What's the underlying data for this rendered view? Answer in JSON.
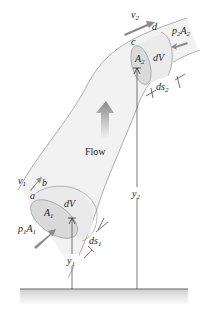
{
  "figure": {
    "colors": {
      "tube_fill": "#f2f2f2",
      "tube_edge": "#9a9a9a",
      "section_fill": "#e2e2e2",
      "arrow_gray": "#8c8c8c",
      "line": "#555555",
      "ground": "#666666"
    },
    "labels": {
      "flow": "Flow",
      "v1": {
        "base": "v",
        "sub": "1"
      },
      "v2": {
        "base": "v",
        "sub": "2"
      },
      "a": "a",
      "b": "b",
      "c": "c",
      "d": "d",
      "A1": {
        "base": "A",
        "sub": "1"
      },
      "A2": {
        "base": "A",
        "sub": "2"
      },
      "dV_lower": "dV",
      "dV_upper": "dV",
      "p1A1": {
        "p": "p",
        "psub": "1",
        "A": "A",
        "Asub": "1"
      },
      "p2A2": {
        "p": "p",
        "psub": "2",
        "A": "A",
        "Asub": "2"
      },
      "ds1": {
        "base": "ds",
        "sub": "1"
      },
      "ds2": {
        "base": "ds",
        "sub": "2"
      },
      "y1": {
        "base": "y",
        "sub": "1"
      },
      "y2": {
        "base": "y",
        "sub": "2"
      }
    }
  }
}
